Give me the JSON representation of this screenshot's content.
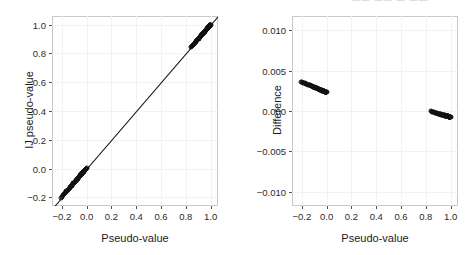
{
  "figure": {
    "top_edge_artifact": "—— —— — ——",
    "panel_border_color": "#c9c9c9",
    "grid_color": "#f2f2f4",
    "marker_color": "#111111",
    "line_color": "#111111",
    "background": "#ffffff"
  },
  "chart_data": [
    {
      "id": "left-panel",
      "type": "scatter",
      "title": "",
      "xlabel": "Pseudo-value",
      "ylabel": "IJ pseudo-value",
      "xlim": [
        -0.28,
        1.06
      ],
      "ylim": [
        -0.26,
        1.06
      ],
      "xticks": [
        -0.2,
        0.0,
        0.2,
        0.4,
        0.6,
        0.8,
        1.0
      ],
      "xticklabels": [
        "-0.2",
        "0.0",
        "0.2",
        "0.4",
        "0.6",
        "0.8",
        "1.0"
      ],
      "yticks": [
        -0.2,
        0.0,
        0.2,
        0.4,
        0.6,
        0.8,
        1.0
      ],
      "yticklabels": [
        "-0.2",
        "0.0",
        "0.2",
        "0.4",
        "0.6",
        "0.8",
        "1.0"
      ],
      "grid": true,
      "legend": "none",
      "reference_line": {
        "type": "identity",
        "slope": 1.0,
        "intercept": 0.0,
        "label": "y = x"
      },
      "series": [
        {
          "name": "pseudo-value agreement",
          "marker": "open-circle",
          "x": [
            -0.205,
            -0.198,
            -0.19,
            -0.183,
            -0.176,
            -0.17,
            -0.163,
            -0.157,
            -0.15,
            -0.144,
            -0.138,
            -0.133,
            -0.127,
            -0.122,
            -0.117,
            -0.112,
            -0.107,
            -0.102,
            -0.098,
            -0.094,
            -0.09,
            -0.086,
            -0.082,
            -0.078,
            -0.074,
            -0.07,
            -0.067,
            -0.063,
            -0.06,
            -0.057,
            -0.054,
            -0.051,
            -0.048,
            -0.045,
            -0.042,
            -0.039,
            -0.036,
            -0.034,
            -0.031,
            -0.029,
            -0.026,
            -0.024,
            -0.022,
            -0.02,
            -0.018,
            -0.016,
            -0.014,
            -0.012,
            -0.01,
            -0.008,
            -0.006,
            -0.005,
            -0.003,
            -0.002,
            -0.001,
            0.842,
            0.851,
            0.859,
            0.866,
            0.873,
            0.88,
            0.886,
            0.892,
            0.898,
            0.903,
            0.908,
            0.913,
            0.918,
            0.922,
            0.926,
            0.93,
            0.934,
            0.938,
            0.941,
            0.945,
            0.948,
            0.951,
            0.954,
            0.957,
            0.959,
            0.962,
            0.964,
            0.967,
            0.969,
            0.971,
            0.973,
            0.975,
            0.977,
            0.979,
            0.981,
            0.982,
            0.984,
            0.986,
            0.987,
            0.989,
            0.99,
            0.991,
            0.993,
            0.994,
            0.995,
            0.996,
            0.997,
            0.998,
            0.999,
            1.0
          ],
          "y": [
            -0.201,
            -0.194,
            -0.186,
            -0.179,
            -0.172,
            -0.166,
            -0.159,
            -0.153,
            -0.146,
            -0.14,
            -0.134,
            -0.129,
            -0.123,
            -0.118,
            -0.113,
            -0.108,
            -0.103,
            -0.099,
            -0.094,
            -0.09,
            -0.086,
            -0.082,
            -0.078,
            -0.074,
            -0.071,
            -0.067,
            -0.064,
            -0.06,
            -0.057,
            -0.054,
            -0.051,
            -0.048,
            -0.045,
            -0.042,
            -0.039,
            -0.036,
            -0.034,
            -0.031,
            -0.029,
            -0.026,
            -0.024,
            -0.021,
            -0.019,
            -0.017,
            -0.015,
            -0.013,
            -0.011,
            -0.01,
            -0.008,
            -0.006,
            -0.004,
            -0.003,
            -0.001,
            0.0,
            0.001,
            0.842,
            0.851,
            0.859,
            0.866,
            0.873,
            0.879,
            0.886,
            0.892,
            0.897,
            0.903,
            0.908,
            0.913,
            0.917,
            0.922,
            0.926,
            0.93,
            0.934,
            0.937,
            0.941,
            0.944,
            0.948,
            0.951,
            0.954,
            0.956,
            0.959,
            0.961,
            0.964,
            0.966,
            0.969,
            0.971,
            0.973,
            0.975,
            0.977,
            0.978,
            0.98,
            0.982,
            0.984,
            0.985,
            0.987,
            0.988,
            0.99,
            0.991,
            0.992,
            0.994,
            0.995,
            0.996,
            0.997,
            0.998,
            0.999,
            0.999
          ]
        }
      ]
    },
    {
      "id": "right-panel",
      "type": "scatter",
      "title": "",
      "xlabel": "Pseudo-value",
      "ylabel": "Difference",
      "xlim": [
        -0.28,
        1.06
      ],
      "ylim": [
        -0.0118,
        0.0118
      ],
      "xticks": [
        -0.2,
        0.0,
        0.2,
        0.4,
        0.6,
        0.8,
        1.0
      ],
      "xticklabels": [
        "-0.2",
        "0.0",
        "0.2",
        "0.4",
        "0.6",
        "0.8",
        "1.0"
      ],
      "yticks": [
        -0.01,
        -0.005,
        0.0,
        0.005,
        0.01
      ],
      "yticklabels": [
        "-0.010",
        "-0.005",
        "0.000",
        "0.005",
        "0.010"
      ],
      "grid": true,
      "legend": "none",
      "series": [
        {
          "name": "difference (pseudo-value − IJ pseudo-value)",
          "marker": "open-circle",
          "x": [
            -0.205,
            -0.198,
            -0.19,
            -0.183,
            -0.176,
            -0.17,
            -0.163,
            -0.157,
            -0.15,
            -0.144,
            -0.138,
            -0.133,
            -0.127,
            -0.122,
            -0.117,
            -0.112,
            -0.107,
            -0.102,
            -0.098,
            -0.094,
            -0.09,
            -0.086,
            -0.082,
            -0.078,
            -0.074,
            -0.07,
            -0.067,
            -0.063,
            -0.06,
            -0.057,
            -0.054,
            -0.051,
            -0.048,
            -0.045,
            -0.042,
            -0.039,
            -0.036,
            -0.034,
            -0.031,
            -0.029,
            -0.026,
            -0.024,
            -0.022,
            -0.02,
            -0.018,
            -0.016,
            -0.014,
            -0.012,
            -0.01,
            -0.008,
            -0.006,
            -0.005,
            -0.003,
            -0.002,
            -0.001,
            0.842,
            0.851,
            0.859,
            0.866,
            0.873,
            0.88,
            0.886,
            0.892,
            0.898,
            0.903,
            0.908,
            0.913,
            0.918,
            0.922,
            0.926,
            0.93,
            0.934,
            0.938,
            0.941,
            0.945,
            0.948,
            0.951,
            0.954,
            0.957,
            0.959,
            0.962,
            0.964,
            0.967,
            0.969,
            0.971,
            0.973,
            0.975,
            0.977,
            0.979,
            0.981,
            0.982,
            0.984,
            0.986,
            0.987,
            0.989,
            0.99,
            0.991,
            0.993,
            0.994,
            0.995,
            0.996,
            0.997,
            0.998,
            0.999,
            1.0
          ],
          "y": [
            0.0036,
            0.00356,
            0.00352,
            0.00348,
            0.00344,
            0.0034,
            0.00336,
            0.00332,
            0.00328,
            0.00324,
            0.0032,
            0.00317,
            0.00313,
            0.0031,
            0.00306,
            0.00303,
            0.003,
            0.00297,
            0.00294,
            0.00291,
            0.00288,
            0.00285,
            0.00282,
            0.0028,
            0.00277,
            0.00275,
            0.00272,
            0.0027,
            0.00268,
            0.00266,
            0.00264,
            0.00262,
            0.0026,
            0.00258,
            0.00256,
            0.00255,
            0.00253,
            0.00252,
            0.0025,
            0.00249,
            0.00247,
            0.00246,
            0.00245,
            0.00244,
            0.00243,
            0.00242,
            0.00241,
            0.0024,
            0.00239,
            0.00238,
            0.00238,
            0.00237,
            0.00237,
            0.00236,
            0.00236,
            -4e-05,
            -8e-05,
            -0.00012,
            -0.00016,
            -0.00019,
            -0.00022,
            -0.00025,
            -0.00028,
            -0.00031,
            -0.00033,
            -0.00036,
            -0.00038,
            -0.0004,
            -0.00042,
            -0.00044,
            -0.00046,
            -0.00048,
            -0.00049,
            -0.00051,
            -0.00052,
            -0.00054,
            -0.00055,
            -0.00056,
            -0.00058,
            -0.00059,
            -0.0006,
            -0.00061,
            -0.00062,
            -0.00063,
            -0.00064,
            -0.00064,
            -0.00065,
            -0.00066,
            -0.00067,
            -0.00067,
            -0.00068,
            -0.00069,
            -0.00069,
            -0.0007,
            -0.0007,
            -0.00071,
            -0.00071,
            -0.00072,
            -0.00072,
            -0.00073,
            -0.00073,
            -0.00073,
            -0.00074,
            -0.00074,
            -0.00074
          ]
        }
      ]
    }
  ]
}
